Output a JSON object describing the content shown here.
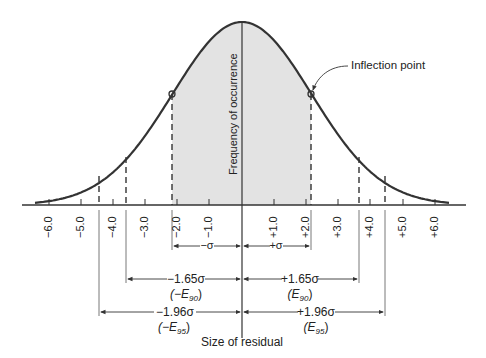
{
  "chart_data": {
    "type": "area",
    "title": "",
    "xlabel": "Size of residual",
    "ylabel": "Frequency of occurrence",
    "x_ticks": [
      "-6.0",
      "-5.0",
      "-4.0",
      "-3.0",
      "-2.0",
      "-1.0",
      "+1.0",
      "+2.0",
      "+3.0",
      "+4.0",
      "+5.0",
      "+6.0"
    ],
    "xlim": [
      -6.5,
      6.5
    ],
    "sigma": 2.15,
    "shaded_region": [
      "-σ",
      "+σ"
    ],
    "annotations": [
      {
        "label": "Inflection point",
        "at": "+σ"
      },
      {
        "label": "-σ",
        "range": [
          "-σ",
          0
        ]
      },
      {
        "label": "+σ",
        "range": [
          0,
          "+σ"
        ]
      },
      {
        "label": "-1.65σ",
        "sub": "(-E90)",
        "range": [
          "-1.65σ",
          0
        ]
      },
      {
        "label": "+1.65σ",
        "sub": "(E90)",
        "range": [
          0,
          "+1.65σ"
        ]
      },
      {
        "label": "-1.96σ",
        "sub": "(-E95)",
        "range": [
          "-1.96σ",
          0
        ]
      },
      {
        "label": "+1.96σ",
        "sub": "(E95)",
        "range": [
          0,
          "+1.96σ"
        ]
      }
    ]
  },
  "labels": {
    "ylabel": "Frequency of occurrence",
    "xlabel": "Size of residual",
    "inflection": "Inflection point",
    "minus_sigma": "−σ",
    "plus_sigma": "+σ",
    "minus_165": "−1.65σ",
    "plus_165": "+1.65σ",
    "minus_196": "−1.96σ",
    "plus_196": "+1.96σ",
    "e90_neg_pre": "(−E",
    "e90_pos_pre": "(E",
    "e95_neg_pre": "(−E",
    "e95_pos_pre": "(E",
    "sub90": "90",
    "sub95": "95",
    "close": ")"
  },
  "ticks": [
    {
      "label": "−6.0",
      "x": 49
    },
    {
      "label": "−5.0",
      "x": 81
    },
    {
      "label": "−4.0",
      "x": 113
    },
    {
      "label": "−3.0",
      "x": 145
    },
    {
      "label": "−2.0",
      "x": 177
    },
    {
      "label": "−1.0",
      "x": 209
    },
    {
      "label": "+1.0",
      "x": 274
    },
    {
      "label": "+2.0",
      "x": 306
    },
    {
      "label": "+3.0",
      "x": 338
    },
    {
      "label": "+4.0",
      "x": 370
    },
    {
      "label": "+5.0",
      "x": 403
    },
    {
      "label": "+6.0",
      "x": 435
    }
  ],
  "colors": {
    "line": "#333333",
    "shade": "#e3e3e3"
  }
}
